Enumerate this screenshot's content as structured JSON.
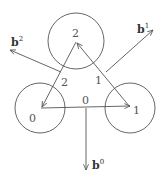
{
  "diagram": {
    "nodes": [
      {
        "id": "0",
        "label": "0",
        "cx": 40,
        "cy": 108,
        "r": 25,
        "point": [
          41,
          108
        ],
        "label_pos": [
          30,
          121
        ]
      },
      {
        "id": "1",
        "label": "1",
        "cx": 130,
        "cy": 108,
        "r": 25,
        "point": [
          130,
          107
        ],
        "label_pos": [
          133,
          113
        ]
      },
      {
        "id": "2",
        "label": "2",
        "cx": 76,
        "cy": 41,
        "r": 28,
        "point": [
          76,
          42
        ],
        "label_pos": [
          72,
          36
        ]
      }
    ],
    "edges": [
      {
        "id": "0",
        "label": "0",
        "from": "0",
        "to": "1",
        "label_pos": [
          82,
          104
        ]
      },
      {
        "id": "1",
        "label": "1",
        "from": "2",
        "to": "1",
        "label_pos": [
          96,
          83
        ]
      },
      {
        "id": "2",
        "label": "2",
        "from": "2",
        "to": "0",
        "label_pos": [
          61,
          85
        ]
      }
    ],
    "vectors": [
      {
        "id": "b0",
        "base": "b",
        "sup": "0",
        "from": [
          86,
          108
        ],
        "to": [
          86,
          170
        ],
        "label_pos": [
          92,
          168
        ]
      },
      {
        "id": "b1",
        "base": "b",
        "sup": "1",
        "from": [
          106,
          72
        ],
        "to": [
          153,
          30
        ],
        "label_pos": [
          137,
          32
        ]
      },
      {
        "id": "b2",
        "base": "b",
        "sup": "2",
        "from": [
          61,
          72
        ],
        "to": [
          10,
          50
        ],
        "label_pos": [
          11,
          45
        ]
      }
    ],
    "stroke_color": "#555555"
  }
}
